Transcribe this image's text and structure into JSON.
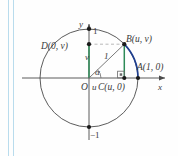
{
  "figure": {
    "colors": {
      "circle": "#4a4a4a",
      "axis": "#4a4a4a",
      "arc_highlight": "#1f3f8f",
      "segment_green": "#2e8b57",
      "radius_line": "#6a6a6a",
      "dashed": "#b0b0b0",
      "text": "#3a3a3a",
      "edge_rule": "#b9dced"
    },
    "axes": {
      "x_label": "x",
      "y_label": "y",
      "y_tick_top": "1",
      "y_tick_bottom": "−1"
    },
    "points": [
      {
        "id": "A",
        "label": "A(1, 0)",
        "x": 1,
        "y": 0
      },
      {
        "id": "B",
        "label": "B(u, v)",
        "x": 0.72,
        "y": 0.69
      },
      {
        "id": "C",
        "label": "C(u, 0)",
        "x": 0.72,
        "y": 0
      },
      {
        "id": "D",
        "label": "D(0, v)",
        "x": 0,
        "y": 0.69
      },
      {
        "id": "O",
        "label": "O",
        "x": 0,
        "y": 0
      }
    ],
    "segment_labels": {
      "radius": "1",
      "horizontal_leg": "u",
      "vertical_leg": "v",
      "angle": "α"
    },
    "markers": {
      "right_angle_at": "C",
      "angle_vertex": "O"
    }
  }
}
